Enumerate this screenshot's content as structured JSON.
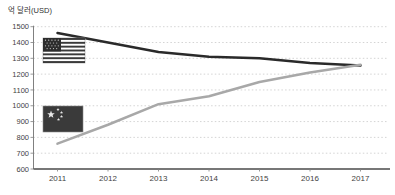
{
  "chart_data": {
    "type": "line",
    "title": "",
    "ylabel": "억 달러(USD)",
    "xlabel": "",
    "categories": [
      "2011",
      "2012",
      "2013",
      "2014",
      "2015",
      "2016",
      "2017"
    ],
    "yticks": [
      1500,
      1400,
      1300,
      1200,
      1100,
      1000,
      900,
      800,
      700,
      600
    ],
    "ylim": [
      600,
      1500
    ],
    "grid": true,
    "gridline_style": "dotted",
    "legend_position": "flag-icons-on-plot",
    "series": [
      {
        "name": "United States",
        "icon": "us-flag-icon",
        "color": "#2a2a2a",
        "values": [
          1460,
          1400,
          1340,
          1310,
          1300,
          1270,
          1255
        ]
      },
      {
        "name": "China",
        "icon": "china-flag-icon",
        "color": "#a8a8a8",
        "values": [
          760,
          880,
          1010,
          1060,
          1150,
          1210,
          1260
        ]
      }
    ]
  },
  "colors": {
    "grid": "#c9c9c9",
    "axis_bottom": "#4a4a4a",
    "axis_left": "#808080",
    "tick_text": "#3f3f3f",
    "flag_dark": "#3a3a3a",
    "flag_light": "#dddddd"
  }
}
